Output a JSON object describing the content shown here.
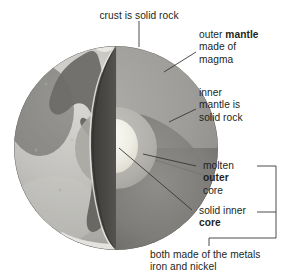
{
  "diagram": {
    "labels": {
      "crust": "crust is solid rock",
      "outer_mantle_line1_a": "outer ",
      "outer_mantle_line1_b": "mantle",
      "outer_mantle_line2": "made of",
      "outer_mantle_line3": "magma",
      "inner_mantle_line1": "inner",
      "inner_mantle_line2": "mantle is",
      "inner_mantle_line3": "solid rock",
      "outer_core_line1": "molten",
      "outer_core_line2": "outer",
      "outer_core_line3": "core",
      "inner_core_line1": "solid inner",
      "inner_core_line2": "core",
      "bracket_note_line1": "both made of the metals",
      "bracket_note_line2": "iron and nickel"
    },
    "layers": [
      {
        "name": "crust",
        "color": "#5d5a57"
      },
      {
        "name": "outer-mantle",
        "color": "#9b9a97"
      },
      {
        "name": "inner-mantle",
        "color": "#8a8987"
      },
      {
        "name": "outer-core",
        "color": "#b5b4b0"
      },
      {
        "name": "inner-core",
        "color": "#eeece4"
      },
      {
        "name": "globe-ocean",
        "color": "#b9b8b4"
      },
      {
        "name": "globe-land",
        "color": "#6f6d69"
      }
    ],
    "colors": {
      "ink": "#231f20",
      "background": "#ffffff",
      "leader_line": "#3a3735"
    }
  }
}
